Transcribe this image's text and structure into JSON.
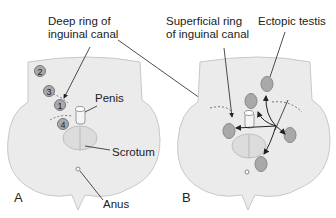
{
  "panels": [
    {
      "letter": "A",
      "labels": {
        "deep_ring": [
          "Deep ring of",
          "inguinal canal"
        ],
        "penis": "Penis",
        "scrotum": "Scrotum",
        "anus": "Anus"
      },
      "markers": [
        "1",
        "2",
        "3",
        "4"
      ]
    },
    {
      "letter": "B",
      "labels": {
        "superficial_ring": [
          "Superficial ring",
          "of inguinal canal"
        ],
        "ectopic_testis": "Ectopic testis"
      }
    }
  ],
  "colors": {
    "body_fill": "#ebebeb",
    "body_stroke": "#c8c8c8",
    "testis_fill": "#a9a9a9",
    "testis_stroke": "#888888",
    "text": "#222222"
  }
}
